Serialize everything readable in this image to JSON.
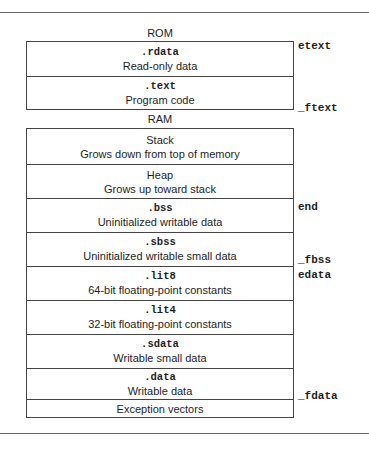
{
  "diagram": {
    "rom": {
      "title": "ROM",
      "sections": [
        {
          "name": ".rdata",
          "desc": "Read-only data"
        },
        {
          "name": ".text",
          "desc": "Program code"
        }
      ]
    },
    "ram": {
      "title": "RAM",
      "sections": [
        {
          "name": "",
          "desc": "Stack",
          "desc2": "Grows down from top of memory"
        },
        {
          "name": "",
          "desc": "Heap",
          "desc2": "Grows up toward stack"
        },
        {
          "name": ".bss",
          "desc": "Uninitialized writable data"
        },
        {
          "name": ".sbss",
          "desc": "Uninitialized writable small data"
        },
        {
          "name": ".lit8",
          "desc": "64-bit floating-point constants"
        },
        {
          "name": ".lit4",
          "desc": "32-bit floating-point constants"
        },
        {
          "name": ".sdata",
          "desc": "Writable small data"
        },
        {
          "name": ".data",
          "desc": "Writable data"
        },
        {
          "name": "",
          "desc": "Exception vectors"
        }
      ]
    },
    "symbols": [
      {
        "label": "etext",
        "y": 43
      },
      {
        "label": "_ftext",
        "y": 103
      },
      {
        "label": "end",
        "y": 201
      },
      {
        "label": "_fbss",
        "y": 257
      },
      {
        "label": "edata",
        "y": 272
      },
      {
        "label": "_fdata",
        "y": 390
      }
    ]
  }
}
